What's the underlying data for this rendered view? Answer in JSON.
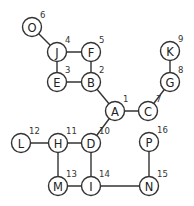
{
  "diagram": {
    "type": "graph-traversal-order",
    "nodes": [
      {
        "id": "A",
        "order": "1",
        "x": 115,
        "y": 111
      },
      {
        "id": "B",
        "order": "2",
        "x": 91,
        "y": 82
      },
      {
        "id": "E",
        "order": "3",
        "x": 57,
        "y": 82
      },
      {
        "id": "J",
        "order": "4",
        "x": 57,
        "y": 52
      },
      {
        "id": "F",
        "order": "5",
        "x": 91,
        "y": 52
      },
      {
        "id": "O",
        "order": "6",
        "x": 32,
        "y": 27
      },
      {
        "id": "C",
        "order": "7",
        "x": 148,
        "y": 111
      },
      {
        "id": "G",
        "order": "8",
        "x": 170,
        "y": 82
      },
      {
        "id": "K",
        "order": "9",
        "x": 170,
        "y": 51
      },
      {
        "id": "D",
        "order": "10",
        "x": 91,
        "y": 143
      },
      {
        "id": "H",
        "order": "11",
        "x": 58,
        "y": 143
      },
      {
        "id": "L",
        "order": "12",
        "x": 21,
        "y": 143
      },
      {
        "id": "M",
        "order": "13",
        "x": 58,
        "y": 186
      },
      {
        "id": "I",
        "order": "14",
        "x": 91,
        "y": 186
      },
      {
        "id": "N",
        "order": "15",
        "x": 149,
        "y": 186
      },
      {
        "id": "P",
        "order": "16",
        "x": 149,
        "y": 142
      }
    ],
    "edges": [
      [
        "O",
        "J"
      ],
      [
        "J",
        "F"
      ],
      [
        "J",
        "E"
      ],
      [
        "F",
        "B"
      ],
      [
        "E",
        "B"
      ],
      [
        "B",
        "A"
      ],
      [
        "A",
        "C"
      ],
      [
        "C",
        "G"
      ],
      [
        "G",
        "K"
      ],
      [
        "A",
        "D"
      ],
      [
        "D",
        "H"
      ],
      [
        "H",
        "L"
      ],
      [
        "H",
        "M"
      ],
      [
        "D",
        "I"
      ],
      [
        "M",
        "I"
      ],
      [
        "I",
        "N"
      ],
      [
        "N",
        "P"
      ]
    ],
    "colors": {
      "stroke": "#333333",
      "fill": "#ffffff",
      "text": "#222222"
    }
  }
}
